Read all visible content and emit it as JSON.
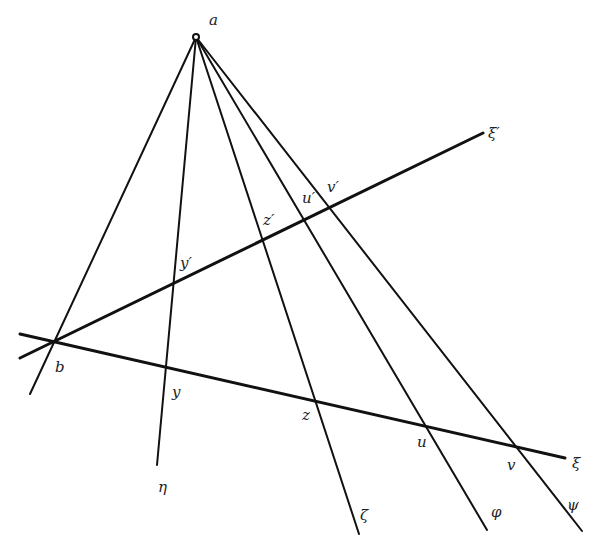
{
  "diagram": {
    "colors": {
      "line": "#111111",
      "label": "#222222",
      "background": "#ffffff"
    },
    "points": {
      "a": {
        "label": "a",
        "x": 196,
        "y": 37
      },
      "b": {
        "label": "b",
        "x": 52,
        "y": 340
      },
      "y": {
        "label": "y",
        "x": 164,
        "y": 366
      },
      "z": {
        "label": "z",
        "x": 303,
        "y": 404
      },
      "u": {
        "label": "u",
        "x": 430,
        "y": 430
      },
      "v": {
        "label": "v",
        "x": 515,
        "y": 449
      },
      "y_prime": {
        "label": "y′",
        "x": 172,
        "y": 278
      },
      "z_prime": {
        "label": "z′",
        "x": 262,
        "y": 235
      },
      "u_prime": {
        "label": "u′",
        "x": 306,
        "y": 212
      },
      "v_prime": {
        "label": "v′",
        "x": 324,
        "y": 203
      }
    },
    "lines": {
      "xi": {
        "label": "ξ"
      },
      "xi_prime": {
        "label": "ξ′"
      },
      "eta": {
        "label": "η"
      },
      "zeta": {
        "label": "ζ"
      },
      "phi": {
        "label": "φ"
      },
      "psi": {
        "label": "ψ"
      }
    }
  }
}
